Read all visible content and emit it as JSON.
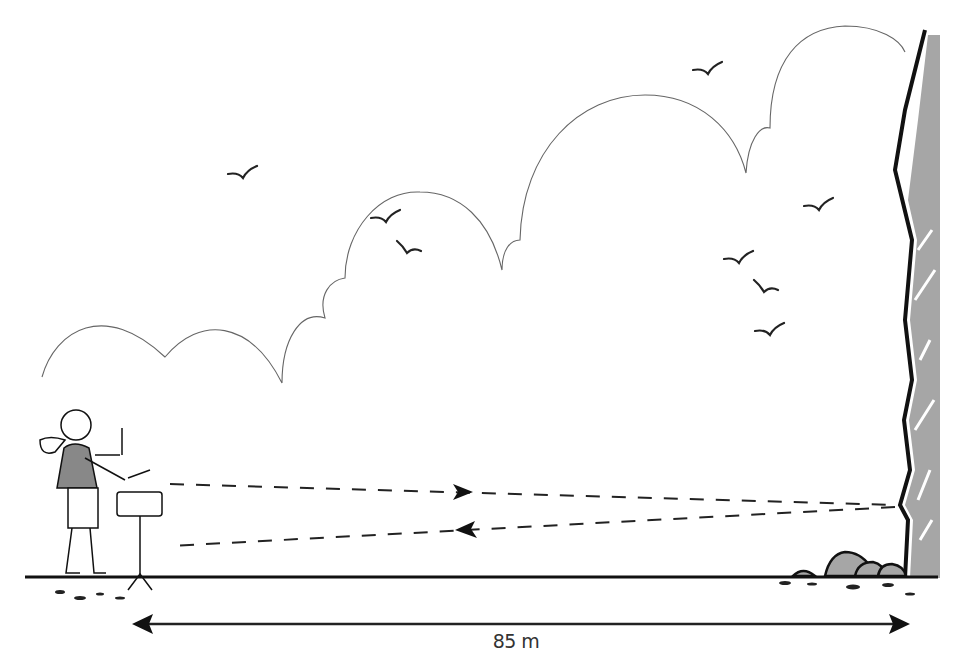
{
  "diagram": {
    "distance_label": "85 m",
    "distance_value": 85,
    "distance_unit": "m",
    "elements": {
      "person": "drummer-with-snare-drum",
      "reflector": "cliff-face",
      "sound_path_outgoing": "dashed arrow toward cliff",
      "sound_path_return": "dashed arrow back toward drummer",
      "birds_count": 9,
      "clouds": "outline cloud line"
    },
    "colors": {
      "line": "#1a1a1a",
      "cloud_outline": "#666666",
      "cliff_fill": "#a6a6a6",
      "background": "#ffffff",
      "label": "#333333"
    }
  }
}
